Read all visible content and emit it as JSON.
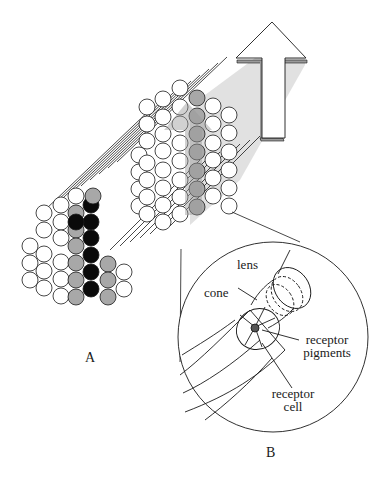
{
  "figure": {
    "type": "compound-eye-diagram",
    "colors": {
      "outline": "#1a1a1a",
      "facet_white": "#ffffff",
      "facet_gray": "#a8a8a8",
      "facet_black": "#0a0a0a",
      "shadow_beam": "#d9d9d9",
      "ghost_arrow": "#b8b8b8",
      "arrow_fill": "#ffffff",
      "arrow_side": "#9a9a9a"
    }
  },
  "panels": {
    "a": {
      "label": "A"
    },
    "b": {
      "label": "B"
    }
  },
  "callouts": {
    "lens": "lens",
    "cone": "cone",
    "receptor_pigments_line1": "receptor",
    "receptor_pigments_line2": "pigments",
    "receptor_cell_line1": "receptor",
    "receptor_cell_line2": "cell"
  },
  "icons": {
    "upward_arrow": "arrow-up-icon"
  }
}
